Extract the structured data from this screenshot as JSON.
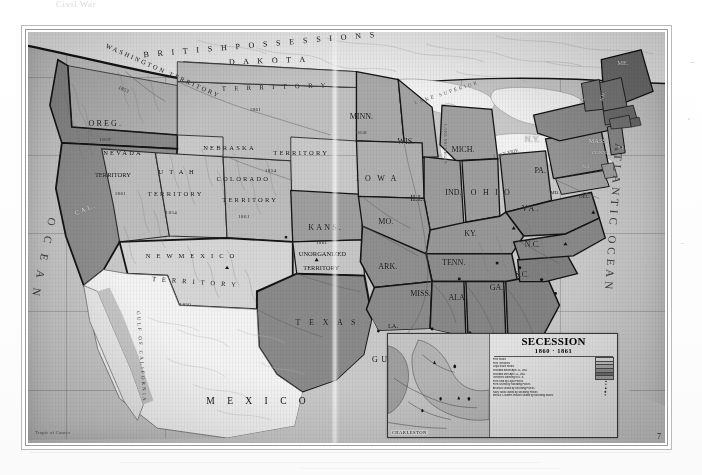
{
  "scan": {
    "top_caption": "Civil War",
    "plate_number": "7",
    "scale_note": "Tropic of Cancer"
  },
  "map": {
    "title": "Secession 1860-1861",
    "oceans": [
      {
        "name": "pacific-ocean",
        "text": "O C E A N"
      },
      {
        "name": "atlantic-ocean",
        "text": "ATLANTIC OCEAN"
      }
    ],
    "water_bodies": [
      {
        "name": "gulf-of-mexico",
        "text": "GULF   OF   MEXICO"
      },
      {
        "name": "gulf-of-california",
        "text": "GULF OF CALIFORNIA"
      },
      {
        "name": "lake-superior",
        "text": "LAKE SUPERIOR"
      },
      {
        "name": "lake-michigan",
        "text": "LAKE MICHIGAN"
      },
      {
        "name": "lake-erie",
        "text": "LAKE ERIE"
      }
    ],
    "foreign": [
      {
        "name": "british-possessions",
        "text": "B R I T I S H     P O S S E S S I O N S"
      },
      {
        "name": "mexico",
        "text": "M E X I C O"
      }
    ],
    "territories": [
      {
        "name": "washington-territory",
        "label": "WASHINGTON TERRITORY",
        "year": "1853"
      },
      {
        "name": "dakota-territory",
        "label_1": "D A K O T A",
        "label_2": "T E R R I T O R Y",
        "year": "1861"
      },
      {
        "name": "nebraska-territory",
        "label_1": "NEBRASKA",
        "label_2": "TERRITORY",
        "year": "1854"
      },
      {
        "name": "nevada-territory",
        "label_1": "NEVADA",
        "label_2": "TERRITORY",
        "year": "1861"
      },
      {
        "name": "utah-territory",
        "label_1": "U T A H",
        "label_2": "TERRITORY",
        "year": "1854"
      },
      {
        "name": "colorado-territory",
        "label_1": "COLORADO",
        "label_2": "TERRITORY",
        "year": "1861"
      },
      {
        "name": "new-mexico-territory",
        "label_1": "N E W   M E X I C O",
        "label_2": "T E R R I T O R Y",
        "year": "1850"
      },
      {
        "name": "unorganized-territory",
        "label_1": "UNORGANIZED",
        "label_2": "TERRITORY",
        "year": ""
      },
      {
        "name": "indian-territory",
        "label_1": "",
        "label_2": "",
        "year": ""
      }
    ],
    "states": [
      {
        "name": "oregon",
        "label": "OREG.",
        "year": "1859"
      },
      {
        "name": "california",
        "label": "CAL.",
        "year": ""
      },
      {
        "name": "minnesota",
        "label": "MINN.",
        "year": "1858"
      },
      {
        "name": "kansas",
        "label": "KANS.",
        "year": "1861"
      },
      {
        "name": "wisconsin",
        "label": "WIS.",
        "year": ""
      },
      {
        "name": "michigan",
        "label": "MICH.",
        "year": ""
      },
      {
        "name": "iowa",
        "label": "I O W A",
        "year": ""
      },
      {
        "name": "illinois",
        "label": "ILL.",
        "year": ""
      },
      {
        "name": "indiana",
        "label": "IND.",
        "year": ""
      },
      {
        "name": "ohio",
        "label": "O H I O",
        "year": ""
      },
      {
        "name": "missouri",
        "label": "MO.",
        "year": ""
      },
      {
        "name": "kentucky",
        "label": "KY.",
        "year": ""
      },
      {
        "name": "tennessee",
        "label": "TENN.",
        "year": ""
      },
      {
        "name": "arkansas",
        "label": "ARK.",
        "year": ""
      },
      {
        "name": "louisiana",
        "label": "LA.",
        "year": ""
      },
      {
        "name": "mississippi",
        "label": "MISS.",
        "year": ""
      },
      {
        "name": "alabama",
        "label": "ALA.",
        "year": ""
      },
      {
        "name": "georgia",
        "label": "GA.",
        "year": ""
      },
      {
        "name": "florida",
        "label": "FLA.",
        "year": ""
      },
      {
        "name": "south-carolina",
        "label": "S.C.",
        "year": ""
      },
      {
        "name": "north-carolina",
        "label": "N.C.",
        "year": ""
      },
      {
        "name": "virginia",
        "label": "VA.",
        "year": ""
      },
      {
        "name": "maryland",
        "label": "MD.",
        "year": ""
      },
      {
        "name": "delaware",
        "label": "DEL.",
        "year": ""
      },
      {
        "name": "pennsylvania",
        "label": "PA.",
        "year": ""
      },
      {
        "name": "new-york",
        "label": "N.Y.",
        "year": ""
      },
      {
        "name": "new-jersey",
        "label": "N.J.",
        "year": ""
      },
      {
        "name": "vermont",
        "label": "VT.",
        "year": ""
      },
      {
        "name": "new-hampshire",
        "label": "N.H.",
        "year": ""
      },
      {
        "name": "massachusetts",
        "label": "MASS.",
        "year": ""
      },
      {
        "name": "rhode-island",
        "label": "R.I.",
        "year": ""
      },
      {
        "name": "connecticut",
        "label": "CONN.",
        "year": ""
      },
      {
        "name": "maine",
        "label": "ME.",
        "year": ""
      },
      {
        "name": "texas",
        "label": "T E X A S",
        "year": ""
      }
    ]
  },
  "legend": {
    "title": "SECESSION",
    "years": "1860 · 1861",
    "subtitle": "Scale of Miles",
    "rows": [
      {
        "label": "Free States",
        "swatch": "#d9d9d9",
        "type": "swatch"
      },
      {
        "label": "Free Territories",
        "swatch": "#c2c2c2",
        "type": "swatch"
      },
      {
        "label": "Loyal Slave States",
        "swatch": "#a8a8a8",
        "type": "swatch"
      },
      {
        "label": "Seceded before April 15, 1861",
        "swatch": "#8d8d8d",
        "type": "swatch"
      },
      {
        "label": "Seceded after April 15, 1861",
        "swatch": "#6f6f6f",
        "type": "swatch"
      },
      {
        "label": "Territories adhering to U. S.",
        "swatch": "#9c9c9c",
        "type": "swatch"
      },
      {
        "label": "Forts held by Loyal Forces",
        "swatch": "",
        "type": "mark",
        "mark": "▲"
      },
      {
        "label": "Forts seized by Seceding Forces",
        "swatch": "",
        "type": "mark",
        "mark": "●"
      },
      {
        "label": "Arsenals seized by Seceding Forces",
        "swatch": "",
        "type": "mark",
        "mark": "■"
      },
      {
        "label": "Navy Yards seized by Seceding Forces",
        "swatch": "",
        "type": "mark",
        "mark": "✚"
      },
      {
        "label": "Mints & Customs Houses seized by Seceding States",
        "swatch": "",
        "type": "mark",
        "mark": "✦"
      }
    ],
    "charleston": {
      "city": "CHARLESTON",
      "sub": "S. CAROLINA"
    }
  },
  "colors": {
    "ocean": "#c9c9c9",
    "free_state": "#b8b8b8",
    "free_territory": "#bdbdbd",
    "border_state": "#a0a0a0",
    "confederate_early": "#8f8f8f",
    "confederate_late": "#7d7d7d",
    "foreign": "#e8e8e8",
    "lake": "#ededed",
    "boundary": "#1d1d1d",
    "paper": "#ffffff"
  }
}
